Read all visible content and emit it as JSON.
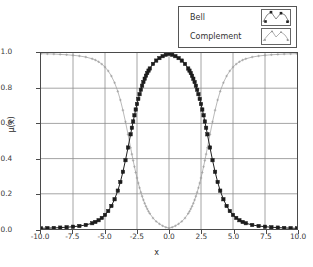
{
  "chart_data": {
    "type": "line",
    "title": "",
    "xlabel": "x",
    "ylabel": "μ(x)",
    "xlim": [
      -10.0,
      10.0
    ],
    "ylim": [
      0.0,
      1.0
    ],
    "grid": true,
    "legend_position": "top-right-outside",
    "xticks": [
      "-10.0",
      "-7.5",
      "-5.0",
      "-2.5",
      "0.0",
      "2.5",
      "5.0",
      "7.5",
      "10.0"
    ],
    "xtick_values": [
      -10.0,
      -7.5,
      -5.0,
      -2.5,
      0.0,
      2.5,
      5.0,
      7.5,
      10.0
    ],
    "yticks": [
      "0.0",
      "0.2",
      "0.4",
      "0.6",
      "0.8",
      "1.0"
    ],
    "ytick_values": [
      0.0,
      0.2,
      0.4,
      0.6,
      0.8,
      1.0
    ],
    "x": [
      -10.0,
      -9.5,
      -9.0,
      -8.5,
      -8.0,
      -7.5,
      -7.0,
      -6.5,
      -6.0,
      -5.75,
      -5.5,
      -5.25,
      -5.0,
      -4.75,
      -4.5,
      -4.25,
      -4.0,
      -3.8,
      -3.6,
      -3.4,
      -3.2,
      -3.0,
      -2.9,
      -2.8,
      -2.7,
      -2.6,
      -2.5,
      -2.4,
      -2.3,
      -2.2,
      -2.1,
      -2.0,
      -1.9,
      -1.8,
      -1.7,
      -1.6,
      -1.5,
      -1.25,
      -1.0,
      -0.75,
      -0.5,
      -0.25,
      0.0,
      0.25,
      0.5,
      0.75,
      1.0,
      1.25,
      1.5,
      1.6,
      1.7,
      1.8,
      1.9,
      2.0,
      2.1,
      2.2,
      2.3,
      2.4,
      2.5,
      2.6,
      2.7,
      2.8,
      2.9,
      3.0,
      3.2,
      3.4,
      3.6,
      3.8,
      4.0,
      4.25,
      4.5,
      4.75,
      5.0,
      5.25,
      5.5,
      5.75,
      6.0,
      6.5,
      7.0,
      7.5,
      8.0,
      8.5,
      9.0,
      9.5,
      10.0
    ],
    "series": [
      {
        "name": "Bell",
        "color": "#1c1c1c",
        "marker": "square",
        "values": [
          0.004,
          0.005,
          0.006,
          0.008,
          0.01,
          0.013,
          0.017,
          0.023,
          0.033,
          0.04,
          0.05,
          0.063,
          0.08,
          0.102,
          0.131,
          0.169,
          0.218,
          0.267,
          0.325,
          0.391,
          0.463,
          0.538,
          0.575,
          0.611,
          0.646,
          0.679,
          0.71,
          0.739,
          0.766,
          0.791,
          0.814,
          0.835,
          0.854,
          0.871,
          0.886,
          0.9,
          0.912,
          0.938,
          0.957,
          0.971,
          0.982,
          0.99,
          0.995,
          0.99,
          0.982,
          0.971,
          0.957,
          0.938,
          0.912,
          0.9,
          0.886,
          0.871,
          0.854,
          0.835,
          0.814,
          0.791,
          0.766,
          0.739,
          0.71,
          0.679,
          0.646,
          0.611,
          0.575,
          0.538,
          0.463,
          0.391,
          0.325,
          0.267,
          0.218,
          0.169,
          0.131,
          0.102,
          0.08,
          0.063,
          0.05,
          0.04,
          0.033,
          0.023,
          0.017,
          0.013,
          0.01,
          0.008,
          0.006,
          0.005,
          0.004
        ]
      },
      {
        "name": "Complement",
        "color": "#9a9a9a",
        "marker": "plus",
        "values": [
          0.996,
          0.995,
          0.994,
          0.992,
          0.99,
          0.987,
          0.983,
          0.977,
          0.967,
          0.96,
          0.95,
          0.937,
          0.92,
          0.898,
          0.869,
          0.831,
          0.782,
          0.733,
          0.675,
          0.609,
          0.537,
          0.462,
          0.425,
          0.389,
          0.354,
          0.321,
          0.29,
          0.261,
          0.234,
          0.209,
          0.186,
          0.165,
          0.146,
          0.129,
          0.114,
          0.1,
          0.088,
          0.062,
          0.043,
          0.029,
          0.018,
          0.01,
          0.005,
          0.01,
          0.018,
          0.029,
          0.043,
          0.062,
          0.088,
          0.1,
          0.114,
          0.129,
          0.146,
          0.165,
          0.186,
          0.209,
          0.234,
          0.261,
          0.29,
          0.321,
          0.354,
          0.389,
          0.425,
          0.462,
          0.537,
          0.609,
          0.675,
          0.733,
          0.782,
          0.831,
          0.869,
          0.898,
          0.92,
          0.937,
          0.95,
          0.96,
          0.967,
          0.977,
          0.983,
          0.987,
          0.99,
          0.992,
          0.994,
          0.995,
          0.996
        ]
      }
    ]
  },
  "legend": {
    "entries": [
      {
        "label": "Bell"
      },
      {
        "label": "Complement"
      }
    ]
  },
  "axes": {
    "xlabel": "x",
    "ylabel": "μ(x)"
  },
  "colors": {
    "bell": "#1c1c1c",
    "complement": "#9a9a9a",
    "grid": "#8c8c8c",
    "frame": "#4a4a4a",
    "background": "#ffffff"
  }
}
